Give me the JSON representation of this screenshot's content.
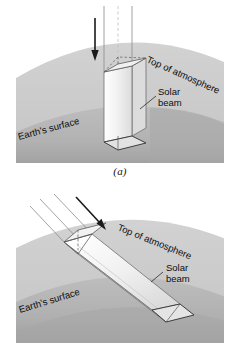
{
  "figure": {
    "panels": [
      {
        "id": "a",
        "caption": "(a)",
        "description": "Overhead sun: vertical solar beam strikes Earth's surface perpendicularly, concentrating energy over a small square area",
        "labels": {
          "top_of_atmosphere": "Top of atmosphere",
          "solar_beam_line1": "Solar",
          "solar_beam_line2": "beam",
          "earths_surface": "Earth's surface"
        }
      },
      {
        "id": "b",
        "caption": "(b)",
        "description": "Low sun angle: slanted solar beam spreads the same energy over a larger, elongated surface area",
        "labels": {
          "top_of_atmosphere": "Top of atmosphere",
          "solar_beam_line1": "Solar",
          "solar_beam_line2": "beam",
          "earths_surface": "Earth's surface"
        }
      }
    ]
  },
  "colors": {
    "background": "#ffffff",
    "atmosphere_band": "#c9c9c9",
    "earth_band": "#b0b0b0",
    "earth_shadow": "#a3a3a3",
    "beam_fill_light": "#f7f7f7",
    "beam_fill_mid": "#e6e6e6",
    "beam_fill_dark": "#d2d2d2",
    "outline": "#4d4d4d",
    "arrow": "#1a1a1a",
    "text": "#0d0d0d"
  },
  "icons": {
    "direction_arrow_a": "down-arrow-icon",
    "direction_arrow_b": "diagonal-down-arrow-icon"
  }
}
